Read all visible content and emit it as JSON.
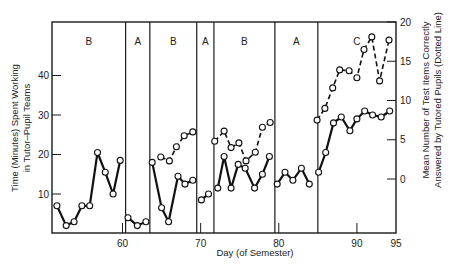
{
  "chart_data": {
    "type": "line",
    "title": "",
    "xlabel": "Day (of Semester)",
    "ylabel": "Time (Minutes) Spent Working in Tutor–Pupil Teams",
    "ylabel_lines": [
      "Time (Minutes) Spent Working",
      "in Tutor–Pupil Teams"
    ],
    "y2label": "Mean Number of Test Items Correctly Answered by Tutored Pupils (Dotted Line)",
    "y2label_lines": [
      "Mean Number of Test Items Correctly",
      "Answered by Tutored Pupils (Dotted Line)"
    ],
    "xlim": [
      51,
      95
    ],
    "ylim": [
      0,
      50
    ],
    "y2lim": [
      -7,
      20
    ],
    "x_ticks": [
      60,
      70,
      80,
      90,
      95
    ],
    "y_ticks": [
      10,
      20,
      30,
      40
    ],
    "y2_ticks": [
      0,
      5,
      10,
      15,
      20
    ],
    "grid": false,
    "phases": [
      {
        "label": "B",
        "start": 51,
        "end": 60.4
      },
      {
        "label": "A",
        "start": 60.4,
        "end": 63.5
      },
      {
        "label": "B",
        "start": 63.5,
        "end": 69.5
      },
      {
        "label": "A",
        "start": 69.5,
        "end": 71.7
      },
      {
        "label": "B",
        "start": 71.7,
        "end": 79.5
      },
      {
        "label": "A",
        "start": 79.5,
        "end": 85
      },
      {
        "label": "C",
        "start": 85,
        "end": 95
      }
    ],
    "series": [
      {
        "name": "Time (Minutes) Spent Working",
        "axis": "left",
        "style": "solid",
        "segments": [
          {
            "x": [
              51.6,
              52.8,
              53.8,
              54.8,
              55.8,
              56.8,
              57.8,
              58.8,
              59.7
            ],
            "y": [
              7,
              2,
              3,
              7,
              7,
              20.5,
              15.5,
              10,
              18.5
            ]
          },
          {
            "x": [
              60.7,
              61.9,
              63.0
            ],
            "y": [
              4,
              2,
              3
            ]
          },
          {
            "x": [
              63.8,
              65.0,
              65.9,
              67.1,
              68.0,
              69.0
            ],
            "y": [
              18,
              6.5,
              3,
              14.5,
              12.5,
              13.5
            ]
          },
          {
            "x": [
              70.1,
              71.0
            ],
            "y": [
              8.5,
              10
            ]
          },
          {
            "x": [
              72.2,
              73.0,
              73.9,
              74.8,
              75.7,
              76.9,
              77.9,
              78.8
            ],
            "y": [
              11.5,
              19.5,
              11.5,
              17.5,
              16.5,
              11.5,
              15,
              19.5
            ]
          },
          {
            "x": [
              79.8,
              80.8,
              81.8,
              82.9,
              83.9
            ],
            "y": [
              12.5,
              15.5,
              13.5,
              16.5,
              12.5
            ]
          },
          {
            "x": [
              85.1,
              86.0,
              87.0,
              88.0,
              89.1,
              90.0,
              91.0,
              92.0,
              93.1,
              94.2
            ],
            "y": [
              15.5,
              20.5,
              28,
              29.5,
              26,
              29,
              31,
              30,
              29.5,
              31
            ]
          }
        ]
      },
      {
        "name": "Mean Number of Test Items Correctly Answered",
        "axis": "right",
        "style": "dashed",
        "segments": [
          {
            "x": [
              64.9,
              66.0,
              66.9,
              67.9,
              69.0
            ],
            "y": [
              2.8,
              2.3,
              4.1,
              5.5,
              6.0
            ]
          },
          {
            "x": [
              71.8,
              73.0,
              73.9,
              74.9,
              75.8,
              77.0,
              77.9,
              78.9
            ],
            "y": [
              4.8,
              6.1,
              4.0,
              4.6,
              2.3,
              3.4,
              6.6,
              7.2
            ]
          },
          {
            "x": [
              84.9,
              85.9,
              86.9,
              87.8,
              89.0,
              90.0,
              90.9,
              91.9,
              92.9,
              94.1
            ],
            "y": [
              7.5,
              9.0,
              11.6,
              13.9,
              13.8,
              12.9,
              16.5,
              18.1,
              12.5,
              17.7
            ]
          }
        ]
      }
    ]
  },
  "labels": {
    "x_axis_title": "Day (of Semester)",
    "y_axis_title_line1": "Time (Minutes) Spent Working",
    "y_axis_title_line2": "in Tutor–Pupil Teams",
    "y2_axis_title_line1": "Mean Number of Test Items Correctly",
    "y2_axis_title_line2": "Answered by Tutored Pupils (Dotted Line)"
  }
}
